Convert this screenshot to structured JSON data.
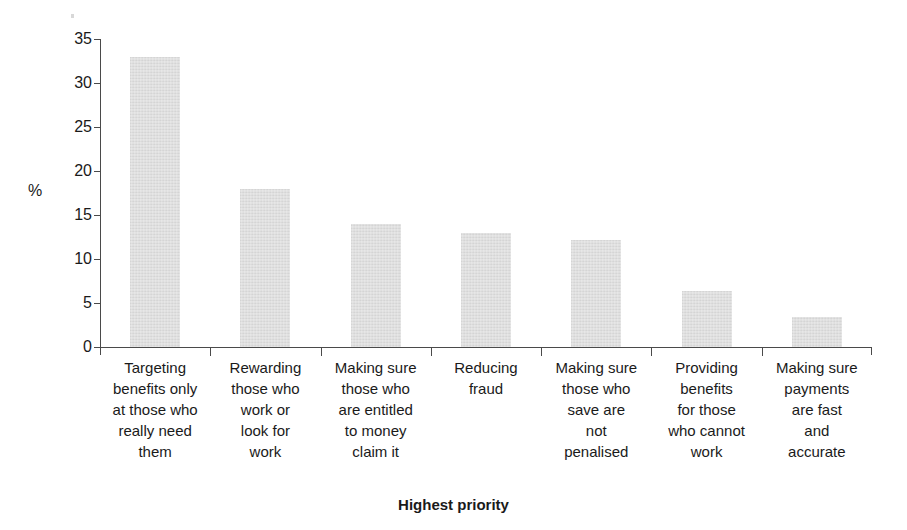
{
  "chart_data": {
    "type": "bar",
    "title": "",
    "xlabel": "Highest priority",
    "ylabel": "%",
    "ylim": [
      0,
      35
    ],
    "yticks": [
      0,
      5,
      10,
      15,
      20,
      25,
      30,
      35
    ],
    "ytick_labels": [
      "0",
      "5",
      "10",
      "15",
      "20",
      "25",
      "30",
      "35"
    ],
    "grid": false,
    "legend": false,
    "bar_color": "#dedede",
    "axis_color": "#4a4a4a",
    "categories": [
      "Targeting benefits only at those who really need them",
      "Rewarding those who work or look for work",
      "Making sure those who are entitled to money claim it",
      "Reducing fraud",
      "Making sure those who save are not penalised",
      "Providing benefits for those who cannot work",
      "Making sure payments are fast and accurate"
    ],
    "category_lines": [
      [
        "Targeting",
        "benefits only",
        "at those who",
        "really need",
        "them"
      ],
      [
        "Rewarding",
        "those who",
        "work or",
        "look for",
        "work"
      ],
      [
        "Making sure",
        "those who",
        "are entitled",
        "to money",
        "claim it"
      ],
      [
        "Reducing",
        "fraud"
      ],
      [
        "Making sure",
        "those who",
        "save are",
        "not",
        "penalised"
      ],
      [
        "Providing",
        "benefits",
        "for those",
        "who cannot",
        "work"
      ],
      [
        "Making sure",
        "payments",
        "are fast",
        "and",
        "accurate"
      ]
    ],
    "values": [
      33,
      18,
      14,
      13,
      12.2,
      6.4,
      3.4
    ]
  }
}
